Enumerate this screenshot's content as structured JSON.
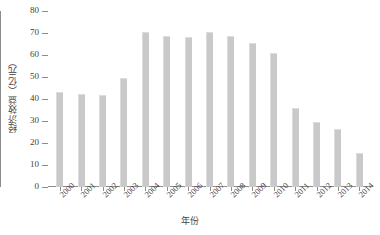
{
  "chart_data": {
    "type": "bar",
    "title": "",
    "xlabel": "年份",
    "ylabel": "经济效益（亿元）",
    "categories": [
      "2000",
      "2001",
      "2002",
      "2003",
      "2004",
      "2005",
      "2006",
      "2007",
      "2008",
      "2009",
      "2010",
      "2011",
      "2012",
      "2013",
      "2014"
    ],
    "values": [
      43,
      42.5,
      42,
      49.5,
      70.5,
      68.5,
      68,
      70.5,
      68.5,
      65.5,
      61,
      36,
      29.5,
      26.5,
      15.5
    ],
    "ylim": [
      0,
      80
    ],
    "yticks": [
      0,
      10,
      20,
      30,
      40,
      50,
      60,
      70,
      80
    ],
    "ytick_labels": [
      "0",
      "10",
      "20",
      "30",
      "40",
      "50",
      "60",
      "70",
      "80"
    ],
    "grid": false,
    "legend": "none",
    "bar_color": "#c9c9c9",
    "axis_color": "#8d8d8d",
    "text_color": "#3f3f3f"
  }
}
